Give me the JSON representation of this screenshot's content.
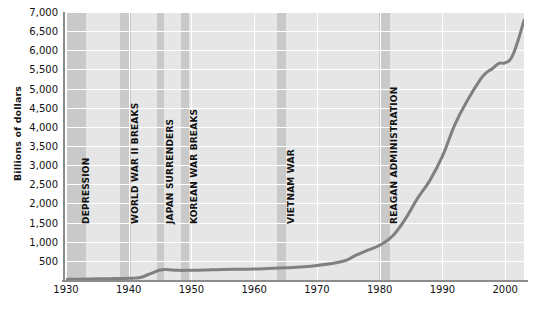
{
  "chart_data": {
    "type": "line",
    "title": "",
    "subtitle": "",
    "xlabel": "",
    "ylabel": "Billions of dollars",
    "xlim": [
      1930,
      2003
    ],
    "ylim": [
      0,
      7000
    ],
    "grid": true,
    "legend_position": "none",
    "line_color": "#808080",
    "plot_background": "#e6e6e6",
    "band_color": "#c9c9c9",
    "gridline_color": "#ffffff",
    "x_ticks": [
      "1930",
      "1940",
      "1950",
      "1960",
      "1970",
      "1980",
      "1990",
      "2000"
    ],
    "x_tick_values": [
      1930,
      1940,
      1950,
      1960,
      1970,
      1980,
      1990,
      2000
    ],
    "y_ticks": [
      "500",
      "1,000",
      "1,500",
      "2,000",
      "2,500",
      "3,000",
      "3,500",
      "4,000",
      "4,500",
      "5,000",
      "5,500",
      "6,000",
      "6,500",
      "7,000"
    ],
    "y_tick_values": [
      500,
      1000,
      1500,
      2000,
      2500,
      3000,
      3500,
      4000,
      4500,
      5000,
      5500,
      6000,
      6500,
      7000
    ],
    "x": [
      1930,
      1932,
      1934,
      1936,
      1938,
      1940,
      1941,
      1942,
      1943,
      1944,
      1945,
      1946,
      1948,
      1950,
      1952,
      1955,
      1960,
      1965,
      1970,
      1974,
      1976,
      1978,
      1980,
      1982,
      1984,
      1986,
      1988,
      1990,
      1992,
      1994,
      1996,
      1997,
      1998,
      1999,
      2000,
      2001,
      2002,
      2003
    ],
    "values": [
      16,
      19,
      27,
      34,
      37,
      43,
      49,
      72,
      137,
      201,
      259,
      271,
      252,
      257,
      259,
      274,
      286,
      317,
      381,
      484,
      629,
      772,
      909,
      1142,
      1572,
      2125,
      2602,
      3233,
      4065,
      4693,
      5225,
      5413,
      5526,
      5656,
      5674,
      5807,
      6228,
      6783
    ],
    "series": [
      {
        "name": "Gross federal debt",
        "values": [
          16,
          19,
          27,
          34,
          37,
          43,
          49,
          72,
          137,
          201,
          259,
          271,
          252,
          257,
          259,
          274,
          286,
          317,
          381,
          484,
          629,
          772,
          909,
          1142,
          1572,
          2125,
          2602,
          3233,
          4065,
          4693,
          5225,
          5413,
          5526,
          5656,
          5674,
          5807,
          6228,
          6783
        ]
      }
    ],
    "annotations": [
      {
        "label": "DEPRESSION",
        "x_start": 1930.0,
        "x_end": 1933.2
      },
      {
        "label": "WORLD WAR II BREAKS",
        "x_start": 1938.6,
        "x_end": 1940.4
      },
      {
        "label": "JAPAN SURRENDERS",
        "x_start": 1944.5,
        "x_end": 1945.6
      },
      {
        "label": "KOREAN WAR BREAKS",
        "x_start": 1948.3,
        "x_end": 1949.6
      },
      {
        "label": "VIETNAM WAR",
        "x_start": 1963.6,
        "x_end": 1965.1
      },
      {
        "label": "REAGAN ADMINISTRATION",
        "x_start": 1979.9,
        "x_end": 1981.6
      }
    ]
  }
}
